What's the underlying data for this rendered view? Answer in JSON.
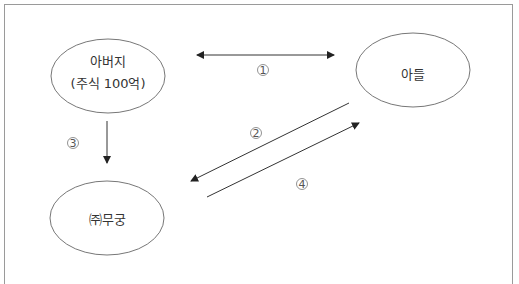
{
  "diagram": {
    "nodes": [
      {
        "id": "father",
        "label_line1": "아버지",
        "label_line2": "(주식 100억)"
      },
      {
        "id": "son",
        "label": "아들"
      },
      {
        "id": "company",
        "label": "㈜무궁"
      }
    ],
    "edges": [
      {
        "id": "1",
        "from": "father",
        "to": "son",
        "bidirectional": true,
        "label": "1"
      },
      {
        "id": "2",
        "from": "son",
        "to": "company",
        "label": "2"
      },
      {
        "id": "3",
        "from": "father",
        "to": "company",
        "label": "3"
      },
      {
        "id": "4",
        "from": "company",
        "to": "son",
        "label": "4"
      }
    ],
    "colors": {
      "stroke": "#333333",
      "ellipse": "#777777",
      "frame": "#9a9a9a"
    }
  }
}
